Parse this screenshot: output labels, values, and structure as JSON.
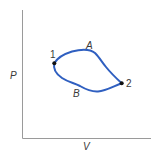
{
  "diagram": {
    "type": "P-V diagram",
    "axes": {
      "y_label": "P",
      "x_label": "V",
      "color": "#9a9a9a"
    },
    "points": [
      {
        "label": "1",
        "x": 54,
        "y": 63
      },
      {
        "label": "2",
        "x": 121,
        "y": 83
      }
    ],
    "paths": [
      {
        "label": "A",
        "description": "upper path from 1 to 2"
      },
      {
        "label": "B",
        "description": "lower path from 1 to 2"
      }
    ],
    "curve_color": "#2f5fc0",
    "point_color": "#111111",
    "label_color": "#3a3a3a"
  }
}
